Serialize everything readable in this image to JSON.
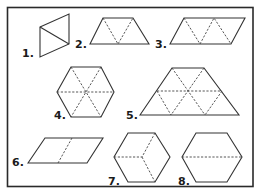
{
  "figure": {
    "border_color": "#2a2a2a",
    "line_color": "#333333",
    "shapes": [
      {
        "label": "1.",
        "name": "parallelogram-split-into-two-triangles"
      },
      {
        "label": "2.",
        "name": "trapezoid-three-triangles"
      },
      {
        "label": "3.",
        "name": "parallelogram-four-triangles"
      },
      {
        "label": "4.",
        "name": "hexagon-six-triangles"
      },
      {
        "label": "5.",
        "name": "large-trapezoid-nine-triangles"
      },
      {
        "label": "6.",
        "name": "parallelogram-split-into-two"
      },
      {
        "label": "7.",
        "name": "hexagon-three-rhombi-cube"
      },
      {
        "label": "8.",
        "name": "hexagon-split-into-two-trapezoids"
      }
    ]
  }
}
